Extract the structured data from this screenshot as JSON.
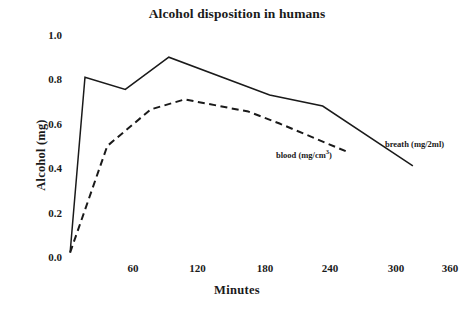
{
  "chart_data": {
    "type": "line",
    "title": "Alcohol disposition in humans",
    "xlabel": "Minutes",
    "ylabel": "Alcohol (mg)",
    "xlim": [
      0,
      360
    ],
    "ylim": [
      0.0,
      1.0
    ],
    "xticks": [
      60,
      120,
      180,
      240,
      300,
      360
    ],
    "xtick_labels": [
      "60",
      "120",
      "180",
      "240",
      "300",
      "360"
    ],
    "yticks": [
      0.0,
      0.2,
      0.4,
      0.6,
      0.8,
      1.0
    ],
    "ytick_labels": [
      "0.0",
      "0.2",
      "0.4",
      "0.6",
      "0.8",
      "1.0"
    ],
    "grid": false,
    "axis_spines": false,
    "legend_position": "inline-annotation",
    "series": [
      {
        "name": "breath (mg/2ml)",
        "style": "solid",
        "color": "#1a1a1a",
        "annotation_text": "breath (mg/2ml)",
        "x": [
          2,
          16,
          54,
          95,
          190,
          240,
          325
        ],
        "values": [
          0.02,
          0.81,
          0.755,
          0.9,
          0.73,
          0.68,
          0.41
        ]
      },
      {
        "name": "blood (mg/cm3)",
        "style": "dashed",
        "color": "#1a1a1a",
        "annotation_text_prefix": "blood (mg/cm",
        "annotation_text_sup": "3",
        "annotation_text_suffix": ")",
        "x": [
          2,
          37,
          78,
          110,
          170,
          200,
          265
        ],
        "values": [
          0.02,
          0.5,
          0.665,
          0.71,
          0.655,
          0.6,
          0.47
        ]
      }
    ]
  }
}
